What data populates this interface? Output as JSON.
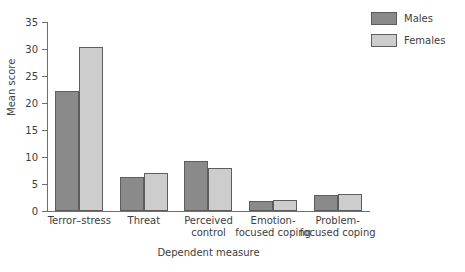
{
  "chart_data": {
    "type": "bar",
    "title": "",
    "xlabel": "Dependent measure",
    "ylabel": "Mean score",
    "ylim": [
      0,
      35
    ],
    "yticks": [
      0,
      5,
      10,
      15,
      20,
      25,
      30,
      35
    ],
    "grid": false,
    "legend_position": "top-right",
    "categories": [
      "Terror–stress",
      "Threat",
      "Perceived\ncontrol",
      "Emotion-\nfocused coping",
      "Problem-\nfocused coping"
    ],
    "category_lines": [
      [
        "Terror–stress"
      ],
      [
        "Threat"
      ],
      [
        "Perceived",
        "control"
      ],
      [
        "Emotion-",
        "focused coping"
      ],
      [
        "Problem-",
        "focused coping"
      ]
    ],
    "series": [
      {
        "name": "Males",
        "color": "#8a8a8a",
        "values": [
          22.3,
          6.3,
          9.2,
          1.8,
          2.9
        ]
      },
      {
        "name": "Females",
        "color": "#cdcdcd",
        "values": [
          30.4,
          7.1,
          7.9,
          2.0,
          3.1
        ]
      }
    ]
  },
  "legend": {
    "items": [
      {
        "label": "Males",
        "color": "#8a8a8a"
      },
      {
        "label": "Females",
        "color": "#cdcdcd"
      }
    ]
  },
  "axes": {
    "y_title": "Mean score",
    "x_title": "Dependent measure",
    "y_tick_labels": [
      "0",
      "5",
      "10",
      "15",
      "20",
      "25",
      "30",
      "35"
    ]
  },
  "colors": {
    "males": "#8a8a8a",
    "females": "#cdcdcd",
    "axis": "#6f6f6f",
    "bar_outline": "#5d5d5d",
    "text": "#3d3d3d",
    "background": "#ffffff"
  }
}
